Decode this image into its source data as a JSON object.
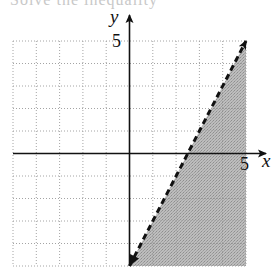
{
  "header": {
    "clipped_text": "Solve the inequality"
  },
  "chart_data": {
    "type": "line",
    "title": "",
    "xlabel": "x",
    "ylabel": "y",
    "xlim": [
      -5,
      5
    ],
    "ylim": [
      -5,
      5
    ],
    "grid": true,
    "grid_style": "dotted",
    "x_tick_labels": [
      {
        "value": 5,
        "label": "5"
      }
    ],
    "y_tick_labels": [
      {
        "value": 5,
        "label": "5"
      }
    ],
    "series": [
      {
        "name": "boundary line",
        "style": "dashed",
        "arrows": "both",
        "x": [
          0,
          5
        ],
        "y": [
          -5,
          5
        ],
        "equation": "y = 2x - 5"
      }
    ],
    "shaded_region": {
      "description": "below/right of boundary line (y < 2x - 5)",
      "polygon": [
        [
          0,
          -5
        ],
        [
          5,
          5
        ],
        [
          5,
          -5
        ]
      ],
      "color": "#b4b4b4"
    },
    "colors": {
      "axis": "#111111",
      "grid": "#9a9a9a",
      "shade": "#b4b4b4",
      "line": "#111111"
    }
  }
}
